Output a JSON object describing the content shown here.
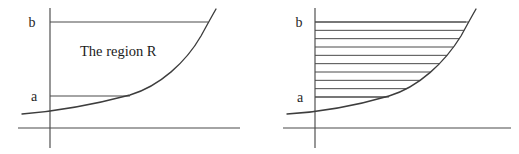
{
  "figure": {
    "width": 519,
    "height": 154,
    "background_color": "#ffffff",
    "stroke_color": "#4a4a4a",
    "curve_color": "#3d3d3d",
    "text_color": "#1c1c1c"
  },
  "panels": [
    {
      "id": "left-panel",
      "name": "region-panel",
      "caption_label": "The region R",
      "labels": {
        "upper_bound": "b",
        "lower_bound": "a"
      },
      "geometry": {
        "y_axis_x": 50,
        "y_axis_top": 8,
        "y_axis_bottom": 148,
        "x_axis_y": 128,
        "x_axis_left": 18,
        "x_axis_right": 240,
        "b_line_y": 22,
        "b_line_x_start": 50,
        "b_line_x_end": 208,
        "a_line_y": 96,
        "a_line_x_start": 50,
        "a_line_x_end": 130,
        "curve_start": [
          22,
          114
        ],
        "curve_end": [
          216,
          9
        ]
      },
      "label_positions": {
        "b": [
          32,
          27
        ],
        "a": [
          34,
          101
        ],
        "caption": [
          80,
          56
        ]
      },
      "hatching": {
        "enabled": false,
        "line_count": 0
      }
    },
    {
      "id": "right-panel",
      "name": "strips-panel",
      "caption_label": "",
      "labels": {
        "upper_bound": "b",
        "lower_bound": "a"
      },
      "geometry": {
        "y_axis_x": 315,
        "y_axis_top": 8,
        "y_axis_bottom": 148,
        "x_axis_y": 128,
        "x_axis_left": 283,
        "x_axis_right": 511,
        "b_line_y": 22,
        "b_line_x_start": 315,
        "b_line_x_end": 466,
        "a_line_y": 97,
        "a_line_x_start": 315,
        "a_line_x_end": 389,
        "curve_start": [
          287,
          114
        ],
        "curve_end": [
          476,
          9
        ]
      },
      "label_positions": {
        "b": [
          299,
          27
        ],
        "a": [
          300,
          102
        ]
      },
      "hatching": {
        "enabled": true,
        "line_count": 10,
        "orientation": "horizontal",
        "top_y": 22,
        "bottom_y": 97,
        "spacing": 8.3,
        "left_x": 315
      }
    }
  ]
}
